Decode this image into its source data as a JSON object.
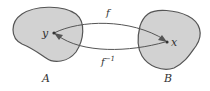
{
  "diagram": {
    "type": "function-mapping",
    "sets": [
      {
        "id": "A",
        "label": "A",
        "fill": "#d2d2d2",
        "stroke": "#555555"
      },
      {
        "id": "B",
        "label": "B",
        "fill": "#d2d2d2",
        "stroke": "#555555"
      }
    ],
    "points": [
      {
        "id": "y",
        "label": "y",
        "set": "A"
      },
      {
        "id": "x",
        "label": "x",
        "set": "B"
      }
    ],
    "arrows": [
      {
        "id": "f",
        "label": "f",
        "from": "y",
        "to": "x"
      },
      {
        "id": "f_inv",
        "label": "f",
        "superscript": "−1",
        "from": "x",
        "to": "y"
      }
    ]
  }
}
